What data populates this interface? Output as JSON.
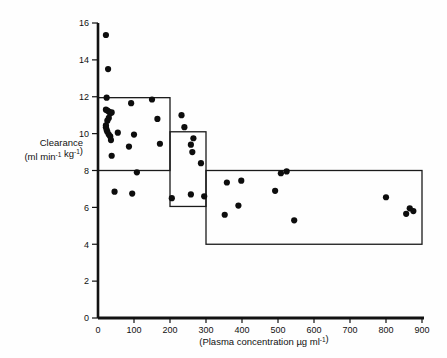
{
  "figure": {
    "background": "#ffffff",
    "ink_color": "#111111"
  },
  "chart_data": {
    "type": "scatter",
    "title": "",
    "xlabel": "(Plasma concentration µg ml⁻¹)",
    "ylabel_line1": "Clearance",
    "ylabel_line2": "(ml min⁻¹ kg⁻¹)",
    "xlim": [
      0,
      900
    ],
    "ylim": [
      0,
      16
    ],
    "xticks": [
      0,
      100,
      200,
      300,
      400,
      500,
      600,
      700,
      800,
      900
    ],
    "yticks": [
      0,
      2,
      4,
      6,
      8,
      10,
      12,
      14,
      16
    ],
    "xtick_labels": [
      "0",
      "100",
      "200",
      "300",
      "400",
      "500",
      "600",
      "700",
      "800",
      "900"
    ],
    "ytick_labels": [
      "0",
      "2",
      "4",
      "6",
      "8",
      "10",
      "12",
      "14",
      "16"
    ],
    "grid": false,
    "legend": null,
    "marker": {
      "shape": "circle",
      "color": "#0d0d0d",
      "size_px": 3.1
    },
    "series": [
      {
        "name": "Clearance observations",
        "points": [
          [
            22,
            15.35
          ],
          [
            28,
            13.5
          ],
          [
            24,
            11.95
          ],
          [
            22,
            11.3
          ],
          [
            26,
            11.25
          ],
          [
            30,
            11.2
          ],
          [
            34,
            11.1
          ],
          [
            38,
            11.15
          ],
          [
            30,
            10.85
          ],
          [
            26,
            10.7
          ],
          [
            22,
            10.45
          ],
          [
            22,
            10.35
          ],
          [
            24,
            10.2
          ],
          [
            26,
            10.1
          ],
          [
            30,
            9.95
          ],
          [
            34,
            9.85
          ],
          [
            36,
            9.65
          ],
          [
            38,
            8.8
          ],
          [
            55,
            10.05
          ],
          [
            92,
            11.65
          ],
          [
            100,
            9.95
          ],
          [
            86,
            9.3
          ],
          [
            108,
            7.9
          ],
          [
            150,
            11.85
          ],
          [
            165,
            10.8
          ],
          [
            172,
            9.45
          ],
          [
            46,
            6.85
          ],
          [
            95,
            6.75
          ],
          [
            205,
            6.5
          ],
          [
            232,
            11.0
          ],
          [
            240,
            10.35
          ],
          [
            265,
            9.75
          ],
          [
            258,
            9.4
          ],
          [
            262,
            9.0
          ],
          [
            258,
            6.7
          ],
          [
            286,
            8.4
          ],
          [
            295,
            6.6
          ],
          [
            358,
            7.35
          ],
          [
            352,
            5.6
          ],
          [
            398,
            7.45
          ],
          [
            390,
            6.1
          ],
          [
            492,
            6.9
          ],
          [
            508,
            7.85
          ],
          [
            524,
            7.95
          ],
          [
            545,
            5.3
          ],
          [
            800,
            6.55
          ],
          [
            856,
            5.65
          ],
          [
            866,
            5.95
          ],
          [
            876,
            5.8
          ]
        ]
      }
    ],
    "range_boxes": [
      {
        "name": "box-low-concentration",
        "x0": 0,
        "x1": 200,
        "y0": 8.0,
        "y1": 11.95
      },
      {
        "name": "box-mid-concentration",
        "x0": 200,
        "x1": 300,
        "y0": 6.05,
        "y1": 10.1
      },
      {
        "name": "box-high-concentration",
        "x0": 300,
        "x1": 900,
        "y0": 4.0,
        "y1": 8.0
      }
    ]
  }
}
